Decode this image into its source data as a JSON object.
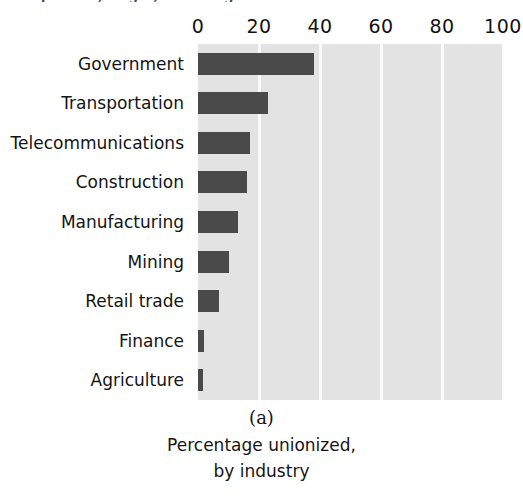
{
  "clipped_heading": "Competition, Wages, and Fringe Benefits",
  "figure": {
    "caption_letter": "(a)",
    "caption_line1": "Percentage unionized,",
    "caption_line2": "by industry"
  },
  "chart_data": {
    "type": "bar",
    "orientation": "horizontal",
    "title": "",
    "xlabel": "",
    "ylabel": "",
    "xlim": [
      0,
      100
    ],
    "xticks": [
      0,
      20,
      40,
      60,
      80,
      100
    ],
    "xtick_labels": [
      "0",
      "20",
      "40",
      "60",
      "80",
      "100"
    ],
    "grid": true,
    "grid_axis": "x",
    "legend": false,
    "plot_background_color": "#e3e3e3",
    "gridline_color": "#fbfbfb",
    "bar_color": "#4a4a4a",
    "annotations": [
      "(a)",
      "Percentage unionized,",
      "by industry"
    ],
    "categories": [
      "Government",
      "Transportation",
      "Telecommunications",
      "Construction",
      "Manufacturing",
      "Mining",
      "Retail trade",
      "Finance",
      "Agriculture"
    ],
    "values": [
      38,
      23,
      17,
      16,
      13,
      10,
      7,
      2,
      1.5
    ]
  }
}
